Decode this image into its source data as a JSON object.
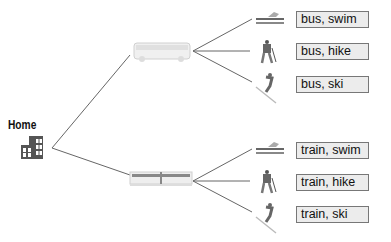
{
  "diagram": {
    "type": "tree",
    "root": {
      "label": "Home",
      "icon": "house-icon"
    },
    "level1": [
      {
        "label": "bus",
        "icon": "bus-icon"
      },
      {
        "label": "train",
        "icon": "train-icon"
      }
    ],
    "level2_icons": [
      "swim-icon",
      "hike-icon",
      "ski-icon"
    ],
    "outcomes": [
      {
        "label": "bus, swim"
      },
      {
        "label": "bus, hike"
      },
      {
        "label": "bus, ski"
      },
      {
        "label": "train, swim"
      },
      {
        "label": "train, hike"
      },
      {
        "label": "train, ski"
      }
    ],
    "colors": {
      "line": "#555555",
      "box_fill": "#ececec",
      "box_border": "#777777",
      "icon": "#555555"
    }
  }
}
